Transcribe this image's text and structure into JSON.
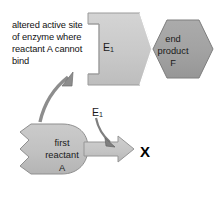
{
  "diagram": {
    "annotation": {
      "text": "altered active site\nof enzyme where\nreactant A cannot\nbind"
    },
    "enzyme": {
      "label": "E",
      "subscript": "1",
      "fill": "#c9c9c9",
      "stroke": "#8e8e8e"
    },
    "end_product": {
      "label": "end\nproduct\nF",
      "fill": "#a3a3a3",
      "stroke": "#767676"
    },
    "reactant": {
      "label": "first\nreactant\nA",
      "fill": "#c2c2c2",
      "stroke": "#8a8a8a"
    },
    "catalyst": {
      "label": "E",
      "subscript": "1"
    },
    "blocked_marker": {
      "label": "X",
      "color": "#000000"
    },
    "reaction_arrow": {
      "fill": "#c6c6c6",
      "stroke": "#8e8e8e"
    },
    "pointer_arrows": {
      "fill": "#8a8a8a",
      "stroke": "#5f5f5f"
    },
    "background": "#ffffff"
  }
}
